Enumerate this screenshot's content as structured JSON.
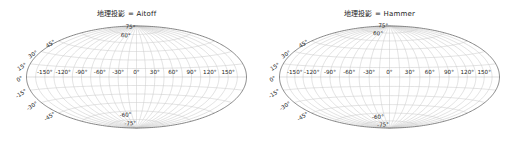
{
  "figure": {
    "background_color": "#ffffff",
    "width": 507,
    "height": 154,
    "grid_color": "#c9c9c9",
    "boundary_color": "#6f6f6f",
    "text_color": "#1c1c1c"
  },
  "chart_data": {
    "type": "scatter",
    "title": "",
    "subplots": [
      {
        "name": "aitoff",
        "title": "地理投影 = Aitoff",
        "title_prefix_cjk": "地理投影",
        "projection": "Aitoff",
        "xlabel": "",
        "ylabel": "",
        "grid": true,
        "legend": "none",
        "xlim": [
          -180,
          180
        ],
        "ylim": [
          -90,
          90
        ],
        "x_tick_labels": [
          "-150°",
          "-120°",
          "-90°",
          "-60°",
          "-30°",
          "0°",
          "30°",
          "60°",
          "90°",
          "120°",
          "150°"
        ],
        "x_tick_values": [
          -150,
          -120,
          -90,
          -60,
          -30,
          0,
          30,
          60,
          90,
          120,
          150
        ],
        "y_tick_labels": [
          "75°",
          "60°",
          "45°",
          "30°",
          "15°",
          "0°",
          "-15°",
          "-30°",
          "-45°",
          "-60°",
          "-75°"
        ],
        "y_tick_values": [
          75,
          60,
          45,
          30,
          15,
          0,
          -15,
          -30,
          -45,
          -60,
          -75
        ],
        "graticule_interval_deg": 15,
        "series": [
          {
            "name": "graticule",
            "values": []
          }
        ]
      },
      {
        "name": "hammer",
        "title": "地理投影 = Hammer",
        "title_prefix_cjk": "地理投影",
        "projection": "Hammer",
        "xlabel": "",
        "ylabel": "",
        "grid": true,
        "legend": "none",
        "xlim": [
          -180,
          180
        ],
        "ylim": [
          -90,
          90
        ],
        "x_tick_labels": [
          "-150°",
          "-120°",
          "-90°",
          "-60°",
          "-30°",
          "0°",
          "30°",
          "60°",
          "90°",
          "120°",
          "150°"
        ],
        "x_tick_values": [
          -150,
          -120,
          -90,
          -60,
          -30,
          0,
          30,
          60,
          90,
          120,
          150
        ],
        "y_tick_labels": [
          "75°",
          "60°",
          "45°",
          "30°",
          "15°",
          "0°",
          "-15°",
          "-30°",
          "-45°",
          "-60°",
          "-75°"
        ],
        "y_tick_values": [
          75,
          60,
          45,
          30,
          15,
          0,
          -15,
          -30,
          -45,
          -60,
          -75
        ],
        "graticule_interval_deg": 15,
        "series": [
          {
            "name": "graticule",
            "values": []
          }
        ]
      }
    ]
  }
}
